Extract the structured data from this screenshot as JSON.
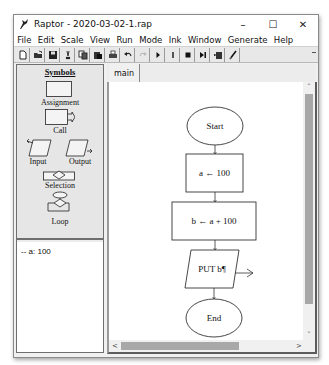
{
  "window": {
    "title": "Raptor - 2020-03-02-1.rap",
    "controls": {
      "minimize": "–",
      "maximize": "☐",
      "close": "✕"
    }
  },
  "menu": [
    "File",
    "Edit",
    "Scale",
    "View",
    "Run",
    "Mode",
    "Ink",
    "Window",
    "Generate",
    "Help"
  ],
  "toolbar": {
    "buttons": [
      {
        "name": "new-file",
        "glyph": ""
      },
      {
        "name": "open-file",
        "glyph": ""
      },
      {
        "name": "save",
        "glyph": ""
      },
      {
        "name": "cut",
        "glyph": "✂"
      },
      {
        "name": "copy",
        "glyph": ""
      },
      {
        "name": "paste",
        "glyph": ""
      },
      {
        "name": "print",
        "glyph": ""
      },
      {
        "name": "undo",
        "glyph": "↶"
      },
      {
        "name": "redo",
        "glyph": "↷"
      },
      {
        "name": "run",
        "glyph": "▶"
      },
      {
        "name": "pause",
        "glyph": "❚"
      },
      {
        "name": "stop",
        "glyph": "■"
      },
      {
        "name": "step",
        "glyph": "▶|"
      },
      {
        "name": "save-run",
        "glyph": ""
      },
      {
        "name": "pen-ink",
        "glyph": ""
      }
    ]
  },
  "symbols_panel": {
    "title": "Symbols",
    "items": [
      {
        "label": "Assignment"
      },
      {
        "label": "Call"
      },
      {
        "label": "Input"
      },
      {
        "label": "Output"
      },
      {
        "label": "Selection"
      },
      {
        "label": "Loop"
      }
    ]
  },
  "variables_panel": {
    "items": [
      {
        "text": "-- a: 100"
      }
    ]
  },
  "tabs": [
    {
      "label": "main",
      "active": true
    }
  ],
  "flowchart": {
    "nodes": [
      {
        "type": "start",
        "text": "Start"
      },
      {
        "type": "assignment",
        "text": "a ← 100"
      },
      {
        "type": "assignment",
        "text": "b ← a + 100"
      },
      {
        "type": "output",
        "text": "PUT b¶"
      },
      {
        "type": "end",
        "text": "End"
      }
    ]
  },
  "scrollbars": {
    "up": "˄",
    "down": "˅",
    "left": "<",
    "right": ">"
  }
}
